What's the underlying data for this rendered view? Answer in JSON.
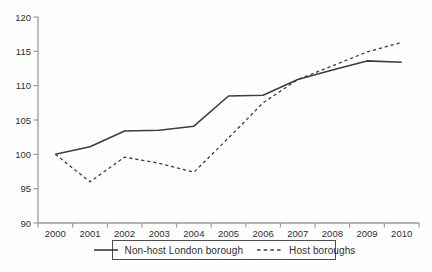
{
  "chart_data": {
    "type": "line",
    "title": "",
    "xlabel": "",
    "ylabel": "",
    "categories": [
      "2000",
      "2001",
      "2002",
      "2003",
      "2004",
      "2005",
      "2006",
      "2007",
      "2008",
      "2009",
      "2010"
    ],
    "series": [
      {
        "name": "Non-host London borough",
        "style": "solid",
        "values": [
          100,
          101.1,
          103.4,
          103.5,
          104.1,
          108.5,
          108.6,
          110.9,
          112.3,
          113.6,
          113.4
        ]
      },
      {
        "name": "Host boroughs",
        "style": "dashed",
        "values": [
          100,
          96.0,
          99.6,
          98.7,
          97.4,
          102.4,
          107.5,
          110.9,
          112.9,
          114.9,
          116.3
        ]
      }
    ],
    "ylim": [
      90,
      120
    ],
    "yticks": [
      90,
      95,
      100,
      105,
      110,
      115,
      120
    ],
    "grid": false,
    "legend_position": "bottom-center",
    "line_color": "#3d3d3d",
    "axis_color": "#9b9b9b",
    "text_color": "#2f2f2f"
  }
}
